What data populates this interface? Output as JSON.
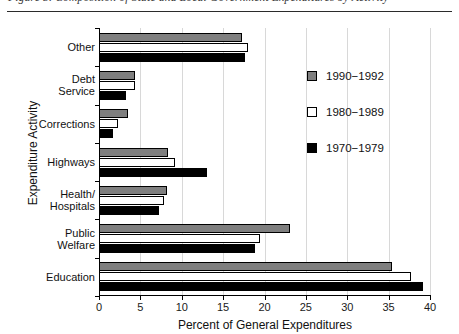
{
  "caption": {
    "text": "Figure 3. Composition of State and Local Government Expenditures by Activity"
  },
  "chart_data": {
    "type": "bar",
    "orientation": "horizontal",
    "title": "",
    "xlabel": "Percent of General Expenditures",
    "ylabel": "Expenditure Activity",
    "xlim": [
      0,
      40
    ],
    "xticks": [
      0,
      5,
      10,
      15,
      20,
      25,
      30,
      35,
      40
    ],
    "xticklabels": [
      "0",
      "5",
      "10",
      "15",
      "20",
      "25",
      "30",
      "35",
      "40"
    ],
    "grid": "vertical",
    "legend_position": "right",
    "categories": [
      "Other",
      "Debt Service",
      "Corrections",
      "Highways",
      "Health/ Hospitals",
      "Public Welfare",
      "Education"
    ],
    "category_lines": [
      [
        "Other"
      ],
      [
        "Debt",
        "Service"
      ],
      [
        "Corrections"
      ],
      [
        "Highways"
      ],
      [
        "Health/",
        "Hospitals"
      ],
      [
        "Public",
        "Welfare"
      ],
      [
        "Education"
      ]
    ],
    "series": [
      {
        "name": "1990-1992",
        "color": "#7f7f7f",
        "values": [
          17.3,
          4.4,
          3.5,
          8.3,
          8.2,
          23.1,
          35.4
        ]
      },
      {
        "name": "1980-1989",
        "color": "#ffffff",
        "values": [
          18.0,
          4.3,
          2.3,
          9.2,
          7.9,
          19.5,
          37.7
        ]
      },
      {
        "name": "1970-1979",
        "color": "#000000",
        "values": [
          17.6,
          3.3,
          1.7,
          13.0,
          7.3,
          18.8,
          39.2
        ]
      }
    ],
    "legend": [
      {
        "label": "1990−1992",
        "swatch": "s1990"
      },
      {
        "label": "1980−1989",
        "swatch": "s1980"
      },
      {
        "label": "1970−1979",
        "swatch": "s1970"
      }
    ]
  }
}
